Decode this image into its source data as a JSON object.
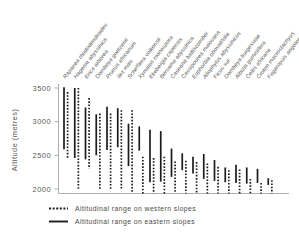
{
  "chart_data": {
    "type": "bar",
    "title": "",
    "xlabel": "",
    "ylabel": "Altitude (metres)",
    "ylim": [
      1830,
      3560
    ],
    "yticks": [
      2000,
      2500,
      3000,
      3500
    ],
    "ytick_labels": [
      "2000",
      "2500",
      "3000",
      "3500"
    ],
    "grid": false,
    "legend_position": "below-plot",
    "orientation": "vertical-range-bars",
    "categories": [
      "Rapanea rhododendroides",
      "Hagenia abyssinica",
      "Erica arborea",
      "Dombeya goetzenii",
      "Prunus africanum",
      "Ilex mitis",
      "Schefflera volkensii",
      "Xymalos monospora",
      "Ekebergia capensis",
      "Bersama abyssinica",
      "Casearia battiscombei",
      "Cassipourea malosana",
      "Euphorbia obovalifolia",
      "Allophylus abyssinicus",
      "Ficus sur",
      "Dombeya burgessiae",
      "Albizia gummifera",
      "Celtis africana",
      "Croton macrostachyus",
      "Fagaropsis angolensis"
    ],
    "series": [
      {
        "name": "Altitudinal range on western slopes",
        "style": "dashed",
        "ranges": [
          [
            2450,
            3440
          ],
          [
            2000,
            3500
          ],
          [
            2300,
            3350
          ],
          [
            2000,
            3120
          ],
          [
            2000,
            3120
          ],
          [
            2000,
            3170
          ],
          [
            1840,
            3170
          ],
          [
            1840,
            2480
          ],
          [
            1840,
            2460
          ],
          [
            1840,
            2480
          ],
          [
            1840,
            2410
          ],
          [
            1840,
            2420
          ],
          [
            1840,
            2400
          ],
          [
            1840,
            2380
          ],
          [
            1840,
            2330
          ],
          [
            1840,
            2280
          ],
          [
            1840,
            2290
          ],
          [
            1840,
            2150
          ],
          [
            1840,
            2090
          ],
          [
            1840,
            2130
          ]
        ]
      },
      {
        "name": "Altitudinal range on eastern slopes",
        "style": "solid",
        "ranges": [
          [
            2590,
            3510
          ],
          [
            2460,
            3500
          ],
          [
            2440,
            3210
          ],
          [
            2500,
            3110
          ],
          [
            2580,
            3220
          ],
          [
            2620,
            3200
          ],
          [
            2340,
            2970
          ],
          [
            2570,
            2930
          ],
          [
            2100,
            2880
          ],
          [
            2110,
            2860
          ],
          [
            2180,
            2600
          ],
          [
            2280,
            2530
          ],
          [
            2230,
            2480
          ],
          [
            2150,
            2520
          ],
          [
            2120,
            2430
          ],
          [
            2100,
            2320
          ],
          [
            2090,
            2360
          ],
          [
            2080,
            2320
          ],
          [
            2090,
            2300
          ],
          [
            2060,
            2160
          ]
        ]
      }
    ]
  },
  "legend": {
    "items": [
      {
        "label": "Altitudinal range on western slopes",
        "style": "dashed"
      },
      {
        "label": "Altitudinal range on eastern slopes",
        "style": "solid"
      }
    ]
  }
}
